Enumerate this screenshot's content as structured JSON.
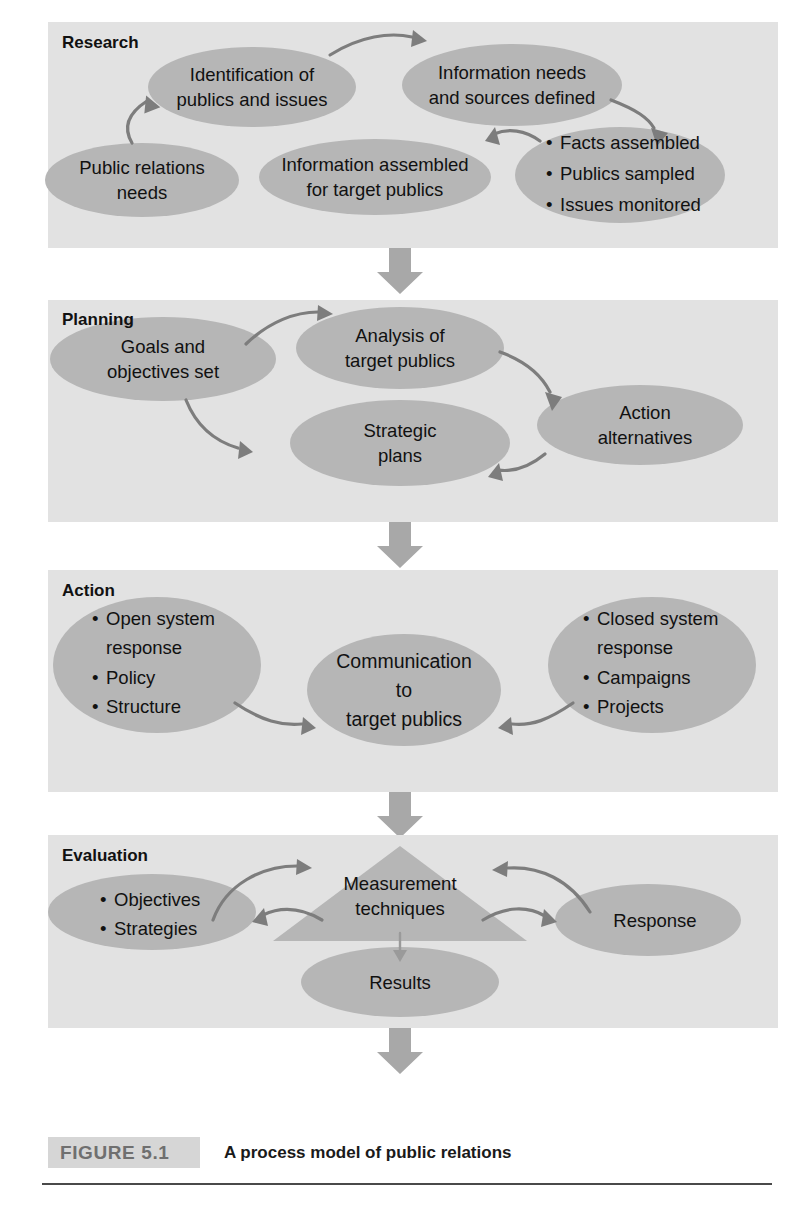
{
  "figure": {
    "tag": "FIGURE 5.1",
    "title": "A process model of public relations"
  },
  "stages": [
    {
      "id": "research",
      "label": "Research",
      "nodes": [
        {
          "id": "public-relations-needs",
          "lines": [
            "Public relations",
            "needs"
          ]
        },
        {
          "id": "identification-of-publics-and-issues",
          "lines": [
            "Identification of",
            "publics and issues"
          ]
        },
        {
          "id": "information-needs-and-sources-defined",
          "lines": [
            "Information needs",
            "and sources defined"
          ]
        },
        {
          "id": "information-assembled-for-target-publics",
          "lines": [
            "Information assembled",
            "for target publics"
          ]
        },
        {
          "id": "research-outputs",
          "bullets": [
            "Facts assembled",
            "Publics sampled",
            "Issues monitored"
          ]
        }
      ]
    },
    {
      "id": "planning",
      "label": "Planning",
      "nodes": [
        {
          "id": "goals-and-objectives-set",
          "lines": [
            "Goals and",
            "objectives set"
          ]
        },
        {
          "id": "analysis-of-target-publics",
          "lines": [
            "Analysis of",
            "target publics"
          ]
        },
        {
          "id": "action-alternatives",
          "lines": [
            "Action",
            "alternatives"
          ]
        },
        {
          "id": "strategic-plans",
          "lines": [
            "Strategic",
            "plans"
          ]
        }
      ]
    },
    {
      "id": "action",
      "label": "Action",
      "nodes": [
        {
          "id": "open-system-response",
          "bullets": [
            "Open system",
            "response",
            "Policy",
            "Structure"
          ]
        },
        {
          "id": "communication-to-target-publics",
          "lines": [
            "Communication",
            "to",
            "target publics"
          ]
        },
        {
          "id": "closed-system-response",
          "bullets": [
            "Closed system",
            "response",
            "Campaigns",
            "Projects"
          ]
        }
      ]
    },
    {
      "id": "evaluation",
      "label": "Evaluation",
      "nodes": [
        {
          "id": "objectives-strategies",
          "bullets": [
            "Objectives",
            "Strategies"
          ]
        },
        {
          "id": "measurement-techniques",
          "lines": [
            "Measurement",
            "techniques"
          ]
        },
        {
          "id": "response",
          "lines": [
            "Response"
          ]
        },
        {
          "id": "results",
          "lines": [
            "Results"
          ]
        }
      ]
    }
  ],
  "text": {
    "research_label": "Research",
    "planning_label": "Planning",
    "action_label": "Action",
    "evaluation_label": "Evaluation",
    "pr_needs_1": "Public relations",
    "pr_needs_2": "needs",
    "ident_1": "Identification of",
    "ident_2": "publics and issues",
    "infoneeds_1": "Information needs",
    "infoneeds_2": "and sources defined",
    "infoassem_1": "Information assembled",
    "infoassem_2": "for target publics",
    "facts": "Facts assembled",
    "publics": "Publics sampled",
    "issues": "Issues monitored",
    "goals_1": "Goals and",
    "goals_2": "objectives set",
    "analysis_1": "Analysis of",
    "analysis_2": "target publics",
    "actionalt_1": "Action",
    "actionalt_2": "alternatives",
    "strategic_1": "Strategic",
    "strategic_2": "plans",
    "open_1": "Open system",
    "open_2": "response",
    "open_3": "Policy",
    "open_4": "Structure",
    "comm_1": "Communication",
    "comm_2": "to",
    "comm_3": "target publics",
    "closed_1": "Closed system",
    "closed_2": "response",
    "closed_3": "Campaigns",
    "closed_4": "Projects",
    "objectives": "Objectives",
    "strategies": "Strategies",
    "measurement_1": "Measurement",
    "measurement_2": "techniques",
    "response": "Response",
    "results": "Results",
    "bullet_glyph": "•"
  },
  "colors": {
    "panel_bg": "#e2e2e2",
    "ellipse_fill": "#b6b6b6",
    "block_arrow": "#a8a8a8",
    "curve_arrow": "#7d7d7d",
    "caption_box": "#d6d6d6",
    "caption_tag_text": "#6f6f6f",
    "page_bg": "#ffffff"
  }
}
